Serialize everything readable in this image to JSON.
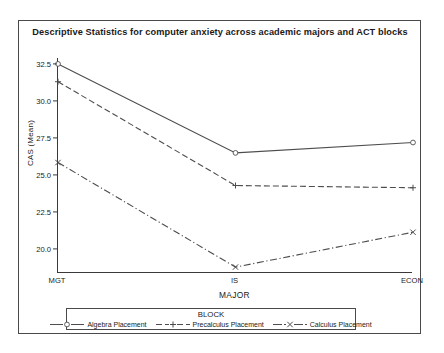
{
  "figure": {
    "title": "Descriptive Statistics for computer anxiety across academic majors and ACT blocks"
  },
  "axes": {
    "y_title": "CAS (Mean)",
    "x_title": "MAJOR",
    "y_ticks": [
      "20.0",
      "22.5",
      "25.0",
      "27.5",
      "30.0",
      "32.5"
    ],
    "x_ticks": [
      "MGT",
      "IS",
      "ECON"
    ]
  },
  "legend": {
    "title": "BLOCK",
    "items": [
      {
        "label": "Algebra Placement",
        "marker": "circle-open",
        "style": "solid"
      },
      {
        "label": "Precalculus Placement",
        "marker": "plus",
        "style": "dashed"
      },
      {
        "label": "Calculus Placement",
        "marker": "x-cross",
        "style": "dash-dot"
      }
    ]
  },
  "chart_data": {
    "type": "line",
    "title": "Descriptive Statistics for computer anxiety across academic majors and ACT blocks",
    "xlabel": "MAJOR",
    "ylabel": "CAS (Mean)",
    "categories": [
      "MGT",
      "IS",
      "ECON"
    ],
    "ylim": [
      18.4,
      32.9
    ],
    "ytick_values": [
      20.0,
      22.5,
      25.0,
      27.5,
      30.0,
      32.5
    ],
    "grid": false,
    "legend_title": "BLOCK",
    "legend_position": "bottom",
    "series": [
      {
        "name": "Algebra Placement",
        "values": [
          32.5,
          26.5,
          27.2
        ],
        "style": "solid",
        "marker": "circle-open",
        "color": "#4d4d4d"
      },
      {
        "name": "Precalculus Placement",
        "values": [
          31.3,
          24.3,
          24.15
        ],
        "style": "dashed",
        "marker": "plus",
        "color": "#4d4d4d"
      },
      {
        "name": "Calculus Placement",
        "values": [
          25.85,
          18.8,
          21.15
        ],
        "style": "dash-dot",
        "marker": "x-cross",
        "color": "#4d4d4d"
      }
    ]
  }
}
